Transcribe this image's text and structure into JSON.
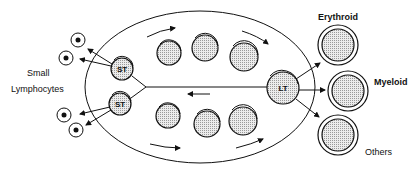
{
  "labels": {
    "small_lymphocytes_line1": "Small",
    "small_lymphocytes_line2": "Lymphocytes",
    "erythroid": "Erythroid",
    "myeloid": "Myeloid",
    "others": "Others"
  },
  "cells": {
    "st_top": "ST",
    "st_bottom": "ST",
    "lt": "LT"
  },
  "colors": {
    "line": "#111111",
    "cell_fill": "#d8d8d8",
    "background": "#ffffff"
  }
}
